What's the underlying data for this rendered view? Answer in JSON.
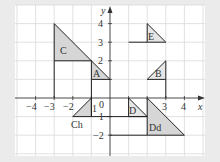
{
  "diagram": {
    "type": "coordinate-grid-transformations",
    "background_color": "#ebebeb",
    "plot_color": "#ffffff",
    "grid_color": "#d9d9d9",
    "shape_fill": "#d6d6d6",
    "line_color": "#222222",
    "axes": {
      "x_label": "x",
      "y_label": "y",
      "x_ticks": [
        "-4",
        "-3",
        "-2",
        "-1",
        "0",
        "1",
        "2",
        "3",
        "4"
      ],
      "y_ticks": [
        "4",
        "3",
        "2",
        "1",
        "-1",
        "-2"
      ],
      "x_range": [
        -5,
        5
      ],
      "y_range": [
        -3,
        5
      ]
    },
    "shapes": [
      {
        "label": "C",
        "vertices": [
          [
            -3,
            4
          ],
          [
            -3,
            2
          ],
          [
            -1,
            2
          ]
        ]
      },
      {
        "label": "A",
        "vertices": [
          [
            -1,
            2
          ],
          [
            -1,
            1
          ],
          [
            0,
            1
          ]
        ]
      },
      {
        "label": "Ch",
        "vertices": [
          [
            -1,
            0
          ],
          [
            -1,
            -1
          ],
          [
            -2,
            -1
          ]
        ]
      },
      {
        "label": "D",
        "vertices": [
          [
            1,
            0
          ],
          [
            1,
            -1
          ],
          [
            2,
            -1
          ]
        ]
      },
      {
        "label": "Dd",
        "vertices": [
          [
            2,
            0
          ],
          [
            2,
            -2
          ],
          [
            4,
            -2
          ]
        ]
      },
      {
        "label": "B",
        "vertices": [
          [
            3,
            2
          ],
          [
            3,
            1
          ],
          [
            2,
            1
          ]
        ]
      },
      {
        "label": "E",
        "vertices": [
          [
            2,
            4
          ],
          [
            2,
            3
          ],
          [
            3,
            3
          ]
        ]
      }
    ],
    "segments": [
      [
        [
          -3,
          2
        ],
        [
          -3,
          0
        ]
      ],
      [
        [
          -1,
          1
        ],
        [
          -1,
          -1
        ]
      ],
      [
        [
          -1,
          -1
        ],
        [
          2,
          -1
        ]
      ],
      [
        [
          0,
          -2
        ],
        [
          2,
          -2
        ]
      ],
      [
        [
          3,
          1
        ],
        [
          3,
          0
        ]
      ],
      [
        [
          1,
          3
        ],
        [
          2,
          3
        ]
      ]
    ],
    "tick_labels": {
      "x_m4": "−4",
      "x_m3": "−3",
      "x_m2": "−2",
      "x_1": "1",
      "x_origin": "0",
      "x_3": "3",
      "x_4": "4",
      "y_4": "4",
      "y_3": "3",
      "y_2": "2",
      "y_1": "1",
      "y_m1": "−1",
      "y_m2": "−2"
    }
  }
}
